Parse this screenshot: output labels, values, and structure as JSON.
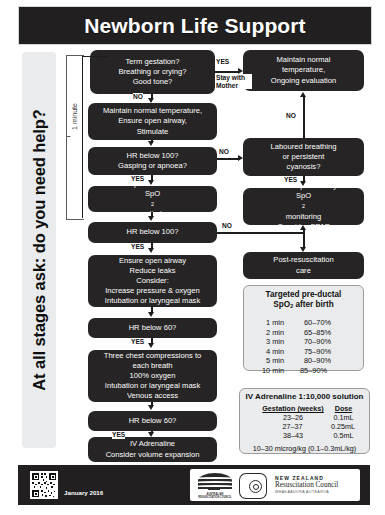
{
  "header": {
    "title": "Newborn Life Support"
  },
  "side_banner": {
    "text": "At all stages ask: do you need help?"
  },
  "timing": {
    "bracket_label": "1 minute"
  },
  "flow": {
    "b1": {
      "l1": "Term gestation?",
      "l2": "Breathing or crying?",
      "l3": "Good tone?"
    },
    "b2": {
      "l1": "Maintain normal temperature,",
      "l2": "Ensure open airway,",
      "l3": "Stimulate"
    },
    "b3": {
      "l1": "HR below 100?",
      "l2": "Gasping or apnoea?"
    },
    "b4": {
      "l1": "Positive pressure ventilation",
      "l2": "SpO",
      "l2sub": "2",
      "l2b": " monitoring"
    },
    "b5": {
      "l1": "HR below 100?"
    },
    "b6": {
      "l1": "Ensure open airway",
      "l2": "Reduce leaks",
      "l3": "Consider:",
      "l4": "Increase pressure & oxygen",
      "l5": "Intubation or laryngeal mask"
    },
    "b7": {
      "l1": "HR below 60?"
    },
    "b8": {
      "l1": "Three chest compressions to",
      "l2": "each breath",
      "l3": "100% oxygen",
      "l4": "Intubation or laryngeal mask",
      "l5": "Venous access"
    },
    "b9": {
      "l1": "HR below 60?"
    },
    "b10": {
      "l1": "IV Adrenaline",
      "l2": "Consider volume expansion"
    },
    "r1": {
      "l1": "Maintain normal",
      "l2": "temperature,",
      "l3": "Ongoing evaluation"
    },
    "r2": {
      "l1": "Laboured breathing",
      "l2": "or persistent",
      "l3": "cyanosis?"
    },
    "r3": {
      "l1": "Ensure open airway",
      "l2": "SpO",
      "l2sub": "2",
      "l2b": " monitoring",
      "l3": "Consider CPAP"
    },
    "r4": {
      "l1": "Post-resuscitation",
      "l2": "care"
    }
  },
  "labels": {
    "yes1": "YES",
    "stay_with_mother": "Stay with Mother",
    "no1": "NO",
    "no2": "NO",
    "yes2": "YES",
    "no3": "NO",
    "yes3": "YES",
    "no4": "NO",
    "yes4": "YES",
    "yes5": "YES",
    "yes6": "YES",
    "yes7": "YES"
  },
  "spo2_box": {
    "title_l1": "Targeted pre-ductal",
    "title_l2a": "SpO",
    "title_sub": "2",
    "title_l2b": " after birth",
    "rows": [
      {
        "time": "1 min",
        "range": "60–70%"
      },
      {
        "time": "2 min",
        "range": "65–85%"
      },
      {
        "time": "3 min",
        "range": "70–90%"
      },
      {
        "time": "4 min",
        "range": "75–90%"
      },
      {
        "time": "5 min",
        "range": "80–90%"
      },
      {
        "time": "10 min",
        "range": "85–90%"
      }
    ]
  },
  "adrenaline_box": {
    "title": "IV Adrenaline 1:10,000 solution",
    "col1": "Gestation (weeks)",
    "col2": "Dose",
    "rows": [
      {
        "gestation": "23–26",
        "dose": "0.1mL"
      },
      {
        "gestation": "27–37",
        "dose": "0.25mL"
      },
      {
        "gestation": "38–43",
        "dose": "0.5mL"
      }
    ],
    "footnote": "10–30 microg/kg (0.1–0.3mL/kg)"
  },
  "footer": {
    "date": "January 2016",
    "nzrc_line1": "NEW ZEALAND",
    "nzrc_line2": "Resuscitation Council",
    "nzrc_line3": "WHAKAAUORA AOTEAROA",
    "arc_text": "AUSTRALIAN RESUSCITATION COUNCIL"
  },
  "colors": {
    "dark": "#262424",
    "title_bg": "#211f1f",
    "panel": "#e9ebec"
  }
}
